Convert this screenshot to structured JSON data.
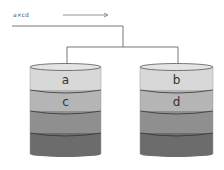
{
  "legend": {
    "text": "a×cd",
    "arrow": "right-arrow"
  },
  "colors": {
    "line": "#555555",
    "band1": "#d8d8d8",
    "band2": "#b5b5b5",
    "band3": "#8f8f8f",
    "band4": "#6c6c6c",
    "outline": "#333333"
  },
  "cylinders": [
    {
      "labels": [
        "a",
        "c",
        "",
        ""
      ]
    },
    {
      "labels": [
        "b",
        "d",
        "",
        ""
      ]
    }
  ]
}
